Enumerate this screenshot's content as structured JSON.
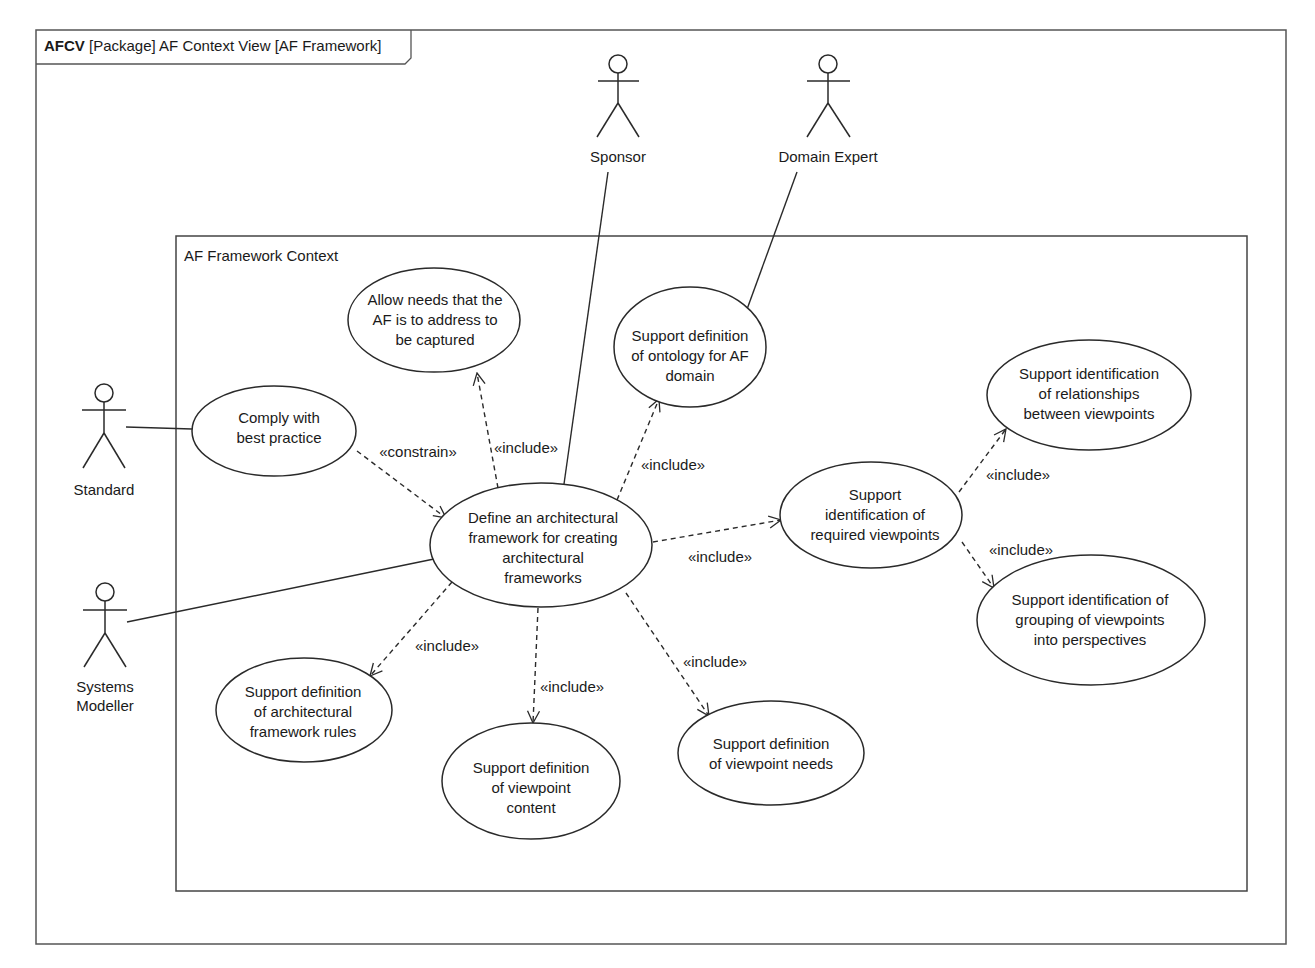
{
  "diagram": {
    "frame": {
      "kind": "AFCV",
      "title": "[Package] AF Context View [AF Framework]"
    },
    "system_boundary": {
      "title": "AF Framework Context"
    },
    "actors": [
      {
        "id": "standard",
        "name": "Standard"
      },
      {
        "id": "systems_modeller",
        "name_lines": [
          "Systems",
          "Modeller"
        ]
      },
      {
        "id": "sponsor",
        "name": "Sponsor"
      },
      {
        "id": "domain_expert",
        "name": "Domain Expert"
      }
    ],
    "use_cases": {
      "comply": [
        "Comply with",
        "best practice"
      ],
      "allow_needs": [
        "Allow needs that the",
        "AF is to address to",
        "be captured"
      ],
      "ontology": [
        "Support definition",
        "of ontology for AF",
        "domain"
      ],
      "define": [
        "Define an architectural",
        "framework for creating",
        "architectural",
        "frameworks"
      ],
      "required_viewpoints": [
        "Support",
        "identification of",
        "required viewpoints"
      ],
      "relationships": [
        "Support identification",
        "of relationships",
        "between viewpoints"
      ],
      "grouping": [
        "Support identification of",
        "grouping of viewpoints",
        "into perspectives"
      ],
      "rules": [
        "Support definition",
        "of architectural",
        "framework rules"
      ],
      "content": [
        "Support definition",
        "of viewpoint",
        "content"
      ],
      "needs": [
        "Support definition",
        "of viewpoint needs"
      ]
    },
    "stereotypes": {
      "constrain": "«constrain»",
      "include_allow": "«include»",
      "include_ontology": "«include»",
      "include_required": "«include»",
      "include_relationships": "«include»",
      "include_grouping": "«include»",
      "include_rules": "«include»",
      "include_content": "«include»",
      "include_needs": "«include»"
    },
    "colors": {
      "line": "#2a2a2a",
      "frame": "#555555",
      "background": "#ffffff"
    }
  }
}
